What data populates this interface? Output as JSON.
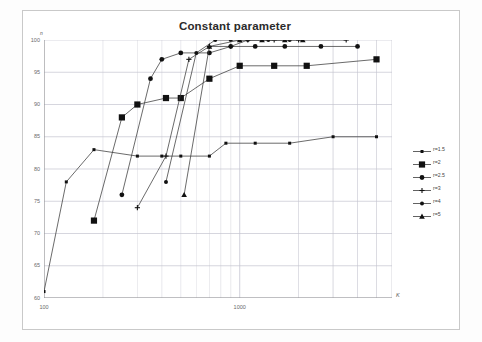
{
  "chart_data": {
    "type": "line",
    "title": "Constant parameter",
    "xlabel": "K",
    "ylabel": "n",
    "xscale": "log",
    "yscale": "linear",
    "xlim": [
      100,
      6000
    ],
    "ylim": [
      60,
      100
    ],
    "yticks": [
      60,
      65,
      70,
      75,
      80,
      85,
      90,
      95,
      100
    ],
    "xticks": [
      100,
      1000
    ],
    "grid": true,
    "legend_position": "right-outside",
    "series": [
      {
        "name": "r=1.5",
        "marker": "small-square",
        "x": [
          100,
          130,
          180,
          300,
          400,
          500,
          700,
          850,
          1200,
          1800,
          3000,
          5000
        ],
        "y": [
          61,
          78,
          83,
          82,
          82,
          82,
          82,
          84,
          84,
          84,
          85,
          85
        ]
      },
      {
        "name": "r=2",
        "marker": "large-square",
        "x": [
          180,
          250,
          300,
          420,
          500,
          700,
          1000,
          1500,
          2200,
          5000
        ],
        "y": [
          72,
          88,
          90,
          91,
          91,
          94,
          96,
          96,
          96,
          97
        ]
      },
      {
        "name": "r=2.5",
        "marker": "circle",
        "x": [
          250,
          350,
          400,
          500,
          700,
          900,
          1200,
          1700,
          2600,
          4000
        ],
        "y": [
          76,
          94,
          97,
          98,
          98,
          99,
          99,
          99,
          99,
          99
        ]
      },
      {
        "name": "r=3",
        "marker": "plus",
        "x": [
          300,
          420,
          550,
          700,
          900,
          1100,
          1500,
          2000,
          3500
        ],
        "y": [
          74,
          82,
          97,
          99,
          99,
          100,
          100,
          100,
          100
        ]
      },
      {
        "name": "r=4",
        "marker": "circle-small",
        "x": [
          420,
          600,
          750,
          900,
          1100,
          1400,
          1800
        ],
        "y": [
          78,
          98,
          100,
          100,
          100,
          100,
          100
        ]
      },
      {
        "name": "r=5",
        "marker": "triangle",
        "x": [
          520,
          700,
          1000,
          1300,
          1700,
          2100
        ],
        "y": [
          76,
          99,
          100,
          100,
          100,
          100
        ]
      }
    ]
  },
  "legend": {
    "items": [
      {
        "label": "r=1.5",
        "marker": "small-square"
      },
      {
        "label": "r=2",
        "marker": "large-square"
      },
      {
        "label": "r=2.5",
        "marker": "circle"
      },
      {
        "label": "r=3",
        "marker": "plus"
      },
      {
        "label": "r=4",
        "marker": "circle-small"
      },
      {
        "label": "r=5",
        "marker": "triangle"
      }
    ]
  },
  "axes": {
    "y_label": "n",
    "x_label": "K",
    "y_tick_labels": [
      "100",
      "95",
      "90",
      "85",
      "80",
      "75",
      "70",
      "65",
      "60"
    ],
    "x_tick_labels": [
      "100",
      "1000"
    ]
  },
  "colors": {
    "line": "#3a3a3a",
    "marker": "#111111",
    "grid": "#c4c4d0",
    "axis": "#8a8a8a",
    "text": "#5a5a5a",
    "title": "#2b2b2b"
  }
}
